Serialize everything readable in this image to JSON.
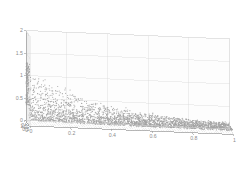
{
  "figure": {
    "kind": "matlab-3d-scatter",
    "background_color": "#ffffff",
    "axis_line_color": "#9a9a9a",
    "grid_color": "#d8d8d8",
    "wall_color": "#fdfdfd",
    "point_color": "#a3a3a3",
    "tick_label_color": "#8d8d8d",
    "title": "",
    "legend": "none"
  },
  "chart_data": {
    "type": "scatter",
    "title": "",
    "xlabel": "",
    "ylabel": "",
    "zlabel": "",
    "grid": true,
    "legend_position": "none",
    "projection": "3d",
    "view": {
      "azimuth": -37.5,
      "elevation": 30
    },
    "xlim": [
      0,
      1
    ],
    "ylim": [
      0,
      2
    ],
    "zlim": [
      0,
      2
    ],
    "xticks": [
      0,
      0.2,
      0.4,
      0.6,
      0.8,
      1
    ],
    "xticklabels": [
      "0",
      "0.2",
      "0.4",
      "0.6",
      "0.8",
      "1"
    ],
    "yticks": [
      0,
      0.5,
      1,
      1.5,
      2
    ],
    "yticklabels": [
      "0",
      "0.5",
      "1",
      "1.5",
      "2"
    ],
    "zticks": [
      0,
      0.5,
      1,
      1.5,
      2
    ],
    "zticklabels": [
      "0",
      "0.5",
      "1",
      "1.5",
      "2"
    ],
    "n_points": 2600,
    "marker": {
      "style": "dot",
      "size_px": 1.1,
      "color": "#a3a3a3"
    },
    "surface_model": {
      "form": "z = a*exp(-b*x)*exp(-c*(2-y)) + noise",
      "a": 1.0,
      "b": 3.2,
      "c": 1.6,
      "noise_scale": 0.22,
      "floor_level": 0.08
    }
  }
}
